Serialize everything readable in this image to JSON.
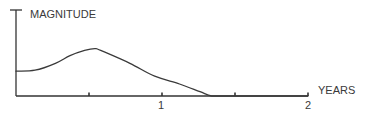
{
  "chart_data": {
    "type": "line",
    "title": "",
    "ylabel": "MAGNITUDE",
    "xlabel": "YEARS",
    "x_ticks": [
      0.5,
      1,
      1.5,
      2
    ],
    "x_tick_labels": [
      {
        "value": 1,
        "label": "1"
      },
      {
        "value": 2,
        "label": "2"
      }
    ],
    "xlim": [
      0,
      2
    ],
    "ylim": [
      0,
      1
    ],
    "grid": false,
    "legend": null,
    "series": [
      {
        "name": "magnitude",
        "x": [
          0.0,
          0.13,
          0.27,
          0.37,
          0.47,
          0.54,
          0.58,
          0.78,
          0.95,
          1.12,
          1.26,
          1.34,
          1.45,
          2.0
        ],
        "y": [
          0.29,
          0.3,
          0.38,
          0.47,
          0.53,
          0.55,
          0.53,
          0.38,
          0.23,
          0.14,
          0.05,
          0.0,
          0.0,
          0.0
        ]
      }
    ]
  },
  "labels": {
    "y_axis": "MAGNITUDE",
    "x_axis": "YEARS",
    "tick_1": "1",
    "tick_2": "2"
  },
  "colors": {
    "line": "#3a3a3a",
    "axis": "#333333",
    "text": "#3a3a3a",
    "background": "#ffffff"
  }
}
